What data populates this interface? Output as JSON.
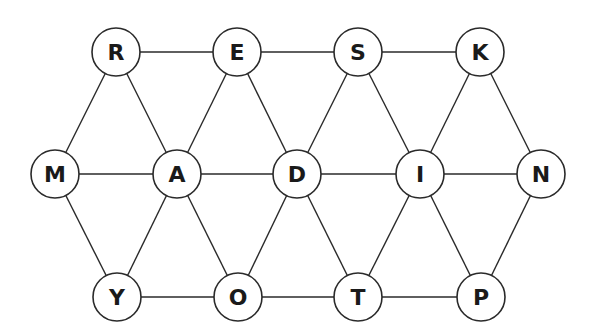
{
  "diagram": {
    "type": "letter-graph",
    "node_radius": 24,
    "nodes": [
      {
        "id": "R",
        "label": "R",
        "x": 116,
        "y": 52
      },
      {
        "id": "E",
        "label": "E",
        "x": 237,
        "y": 52
      },
      {
        "id": "S",
        "label": "S",
        "x": 358,
        "y": 52
      },
      {
        "id": "K",
        "label": "K",
        "x": 480,
        "y": 52
      },
      {
        "id": "M",
        "label": "M",
        "x": 55,
        "y": 174
      },
      {
        "id": "A",
        "label": "A",
        "x": 177,
        "y": 174
      },
      {
        "id": "D",
        "label": "D",
        "x": 297,
        "y": 174
      },
      {
        "id": "I",
        "label": "I",
        "x": 420,
        "y": 174
      },
      {
        "id": "N",
        "label": "N",
        "x": 541,
        "y": 174
      },
      {
        "id": "Y",
        "label": "Y",
        "x": 117,
        "y": 297
      },
      {
        "id": "O",
        "label": "O",
        "x": 238,
        "y": 297
      },
      {
        "id": "T",
        "label": "T",
        "x": 358,
        "y": 297
      },
      {
        "id": "P",
        "label": "P",
        "x": 481,
        "y": 297
      }
    ],
    "edges": [
      [
        "R",
        "E"
      ],
      [
        "E",
        "S"
      ],
      [
        "S",
        "K"
      ],
      [
        "M",
        "A"
      ],
      [
        "A",
        "D"
      ],
      [
        "D",
        "I"
      ],
      [
        "I",
        "N"
      ],
      [
        "Y",
        "O"
      ],
      [
        "O",
        "T"
      ],
      [
        "T",
        "P"
      ],
      [
        "R",
        "M"
      ],
      [
        "R",
        "A"
      ],
      [
        "E",
        "A"
      ],
      [
        "E",
        "D"
      ],
      [
        "S",
        "D"
      ],
      [
        "S",
        "I"
      ],
      [
        "K",
        "I"
      ],
      [
        "K",
        "N"
      ],
      [
        "M",
        "Y"
      ],
      [
        "A",
        "Y"
      ],
      [
        "A",
        "O"
      ],
      [
        "D",
        "O"
      ],
      [
        "D",
        "T"
      ],
      [
        "I",
        "T"
      ],
      [
        "I",
        "P"
      ],
      [
        "N",
        "P"
      ]
    ]
  }
}
